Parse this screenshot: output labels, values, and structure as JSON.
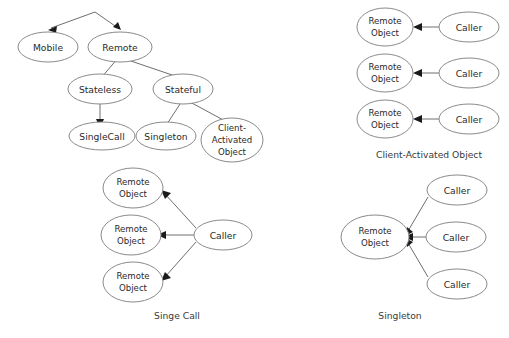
{
  "figure": {
    "background_color": "#ffffff",
    "stroke_color": "#8a8a8a",
    "edge_color": "#6e6e6e",
    "text_color": "#2b2b2b",
    "arrow_color": "#1a1a1a"
  },
  "taxonomy_tree": {
    "nodes": {
      "mobile": "Mobile",
      "remote": "Remote",
      "stateless": "Stateless",
      "stateful": "Stateful",
      "single_call": "SingleCall",
      "singleton": "Singleton",
      "client_activated_line1": "Client-",
      "client_activated_line2": "Activated",
      "client_activated_line3": "Object"
    }
  },
  "client_activated_diagram": {
    "caption": "Client-Activated Object",
    "rows": [
      {
        "remote_object_line1": "Remote",
        "remote_object_line2": "Object",
        "caller": "Caller"
      },
      {
        "remote_object_line1": "Remote",
        "remote_object_line2": "Object",
        "caller": "Caller"
      },
      {
        "remote_object_line1": "Remote",
        "remote_object_line2": "Object",
        "caller": "Caller"
      }
    ]
  },
  "single_call_diagram": {
    "caption": "Singe Call",
    "caller": "Caller",
    "remote_objects": [
      {
        "line1": "Remote",
        "line2": "Object"
      },
      {
        "line1": "Remote",
        "line2": "Object"
      },
      {
        "line1": "Remote",
        "line2": "Object"
      }
    ]
  },
  "singleton_diagram": {
    "caption": "Singleton",
    "remote_object_line1": "Remote",
    "remote_object_line2": "Object",
    "callers": [
      "Caller",
      "Caller",
      "Caller"
    ]
  }
}
